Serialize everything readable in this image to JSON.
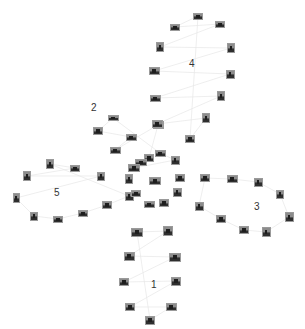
{
  "diagram": {
    "type": "image-cluster-graph",
    "background": "#ffffff",
    "edge_color": "#e6e6e6",
    "clusters": [
      {
        "id": "1",
        "label": "1",
        "label_pos": [
          154,
          285
        ],
        "thumbs": [
          [
            137,
            232,
            12,
            9
          ],
          [
            168,
            231,
            10,
            10
          ],
          [
            129,
            256,
            11,
            9
          ],
          [
            175,
            257,
            12,
            9
          ],
          [
            124,
            282,
            10,
            8
          ],
          [
            176,
            281,
            10,
            9
          ],
          [
            130,
            307,
            10,
            8
          ],
          [
            171,
            307,
            11,
            8
          ],
          [
            150,
            320,
            10,
            9
          ]
        ]
      },
      {
        "id": "2",
        "label": "2",
        "label_pos": [
          94,
          108
        ],
        "thumbs": [
          [
            113,
            118,
            11,
            6
          ],
          [
            98,
            131,
            10,
            8
          ],
          [
            131,
            137,
            11,
            7
          ],
          [
            115,
            150,
            11,
            7
          ],
          [
            158,
            125,
            11,
            8
          ],
          [
            149,
            158,
            10,
            8
          ],
          [
            141,
            162,
            12,
            7
          ],
          [
            134,
            168,
            12,
            8
          ],
          [
            175,
            160,
            9,
            9
          ],
          [
            160,
            153,
            11,
            7
          ]
        ]
      },
      {
        "id": "3",
        "label": "3",
        "label_pos": [
          257,
          207
        ],
        "thumbs": [
          [
            205,
            178,
            10,
            8
          ],
          [
            232,
            179,
            11,
            8
          ],
          [
            258,
            182,
            9,
            9
          ],
          [
            280,
            194,
            8,
            9
          ],
          [
            289,
            217,
            9,
            10
          ],
          [
            266,
            232,
            9,
            10
          ],
          [
            244,
            230,
            10,
            8
          ],
          [
            221,
            219,
            10,
            8
          ],
          [
            199,
            206,
            9,
            9
          ]
        ]
      },
      {
        "id": "4",
        "label": "4",
        "label_pos": [
          192,
          64
        ],
        "thumbs": [
          [
            198,
            16,
            10,
            7
          ],
          [
            175,
            27,
            10,
            7
          ],
          [
            220,
            24,
            10,
            7
          ],
          [
            160,
            47,
            8,
            10
          ],
          [
            231,
            48,
            8,
            10
          ],
          [
            154,
            71,
            11,
            8
          ],
          [
            230,
            74,
            9,
            9
          ],
          [
            155,
            98,
            11,
            7
          ],
          [
            221,
            96,
            8,
            10
          ],
          [
            157,
            124,
            11,
            8
          ],
          [
            206,
            118,
            8,
            10
          ],
          [
            190,
            139,
            10,
            8
          ]
        ]
      },
      {
        "id": "5",
        "label": "5",
        "label_pos": [
          57,
          193
        ],
        "thumbs": [
          [
            50,
            164,
            8,
            10
          ],
          [
            75,
            168,
            10,
            7
          ],
          [
            27,
            176,
            8,
            10
          ],
          [
            101,
            176,
            8,
            9
          ],
          [
            16,
            198,
            7,
            10
          ],
          [
            34,
            216,
            8,
            9
          ],
          [
            58,
            219,
            10,
            7
          ],
          [
            83,
            213,
            10,
            7
          ],
          [
            107,
            205,
            10,
            8
          ],
          [
            129,
            196,
            9,
            9
          ]
        ]
      },
      {
        "id": "center",
        "label": "",
        "thumbs": [
          [
            129,
            179,
            8,
            10
          ],
          [
            155,
            181,
            12,
            8
          ],
          [
            180,
            178,
            10,
            8
          ],
          [
            136,
            193,
            10,
            7
          ],
          [
            149,
            204,
            11,
            7
          ],
          [
            164,
            203,
            10,
            8
          ],
          [
            177,
            192,
            9,
            9
          ]
        ]
      }
    ]
  }
}
